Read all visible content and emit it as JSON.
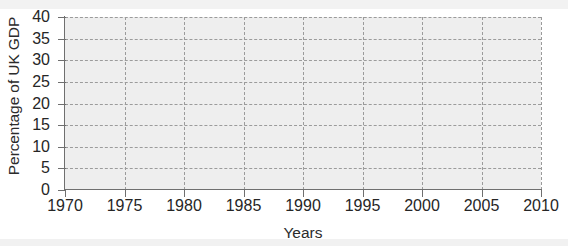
{
  "chart_data": {
    "type": "line",
    "title": "",
    "subtitle": "",
    "xlabel": "Years",
    "ylabel": "Percentage of UK GDP",
    "xlim": [
      1970,
      2010
    ],
    "ylim": [
      0,
      40
    ],
    "xticks": [
      1970,
      1975,
      1980,
      1985,
      1990,
      1995,
      2000,
      2005,
      2010
    ],
    "xtick_labels": [
      "1970",
      "1975",
      "1980",
      "1985",
      "1990",
      "1995",
      "2000",
      "2005",
      "2010"
    ],
    "yticks": [
      0,
      5,
      10,
      15,
      20,
      25,
      30,
      35,
      40
    ],
    "ytick_labels": [
      "0",
      "5",
      "10",
      "15",
      "20",
      "25",
      "30",
      "35",
      "40"
    ],
    "grid": true,
    "grid_style": "dashed",
    "legend": null,
    "legend_position": "none",
    "annotations": [],
    "series": [],
    "note": "Empty axes template - blank grid with no plotted data series",
    "colors": {
      "plot_background": "#eeeeee",
      "gridline": "#9b9b9b",
      "axis": "#6f6f6f",
      "text": "#262626",
      "page_background": "#ffffff"
    }
  },
  "axes": {
    "y_title": "Percentage of UK GDP",
    "x_title": "Years"
  }
}
